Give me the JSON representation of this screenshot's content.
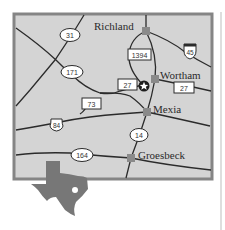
{
  "map": {
    "colors": {
      "land": "#d4d4d4",
      "border": "#858585",
      "road": "#2b2b2b",
      "city_marker": "#8a8a8a",
      "texas": "#777777",
      "shield_fill": "#ffffff"
    },
    "cities": [
      {
        "name": "Richland",
        "x": 146,
        "y": 31
      },
      {
        "name": "Wortham",
        "x": 155,
        "y": 79
      },
      {
        "name": "Mexia",
        "x": 147,
        "y": 112
      },
      {
        "name": "Groesbeck",
        "x": 131,
        "y": 158
      }
    ],
    "highways": [
      {
        "label": "31",
        "type": "state-oval"
      },
      {
        "label": "171",
        "type": "state-oval"
      },
      {
        "label": "27",
        "type": "farm-road-box"
      },
      {
        "label": "27",
        "type": "farm-road-box"
      },
      {
        "label": "73",
        "type": "farm-road-box"
      },
      {
        "label": "1394",
        "type": "farm-road-box"
      },
      {
        "label": "45",
        "type": "interstate-shield"
      },
      {
        "label": "84",
        "type": "us-shield"
      },
      {
        "label": "14",
        "type": "state-oval"
      },
      {
        "label": "164",
        "type": "state-oval"
      }
    ],
    "marker": {
      "label": "star",
      "description": "location-star"
    },
    "inset": {
      "name": "Texas"
    }
  }
}
